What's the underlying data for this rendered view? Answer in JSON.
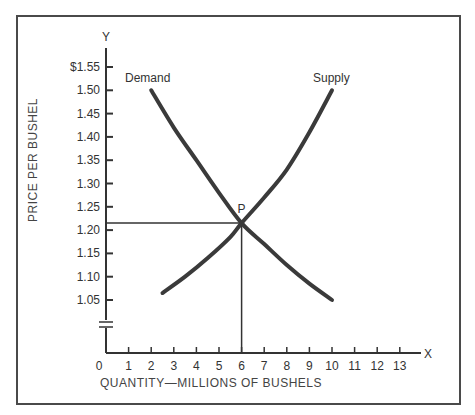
{
  "chart_data": {
    "type": "line",
    "title": "",
    "xlabel": "QUANTITY—MILLIONS OF BUSHELS",
    "ylabel": "PRICE PER BUSHEL",
    "x_axis_letter": "X",
    "y_axis_letter": "Y",
    "x_ticks": [
      "0",
      "1",
      "2",
      "3",
      "4",
      "5",
      "6",
      "7",
      "8",
      "9",
      "10",
      "11",
      "12",
      "13"
    ],
    "y_ticks": [
      "$1.55",
      "1.50",
      "1.45",
      "1.40",
      "1.35",
      "1.30",
      "1.25",
      "1.20",
      "1.15",
      "1.10",
      "1.05"
    ],
    "xlim": [
      0,
      13.5
    ],
    "ylim": [
      1.0,
      1.58
    ],
    "y_axis_break": true,
    "grid": false,
    "legend": null,
    "series": [
      {
        "name": "Demand",
        "points": [
          [
            2,
            1.5
          ],
          [
            3,
            1.42
          ],
          [
            4,
            1.35
          ],
          [
            5,
            1.28
          ],
          [
            6,
            1.215
          ],
          [
            7,
            1.17
          ],
          [
            8,
            1.125
          ],
          [
            9,
            1.085
          ],
          [
            10,
            1.05
          ]
        ]
      },
      {
        "name": "Supply",
        "points": [
          [
            2.5,
            1.065
          ],
          [
            3.5,
            1.1
          ],
          [
            4.5,
            1.14
          ],
          [
            5.5,
            1.185
          ],
          [
            6,
            1.215
          ],
          [
            7,
            1.27
          ],
          [
            8,
            1.33
          ],
          [
            9,
            1.41
          ],
          [
            10,
            1.5
          ]
        ]
      }
    ],
    "annotations": [
      {
        "label": "P",
        "x": 6,
        "y": 1.215,
        "note": "Equilibrium point with guide lines to both axes"
      }
    ]
  }
}
